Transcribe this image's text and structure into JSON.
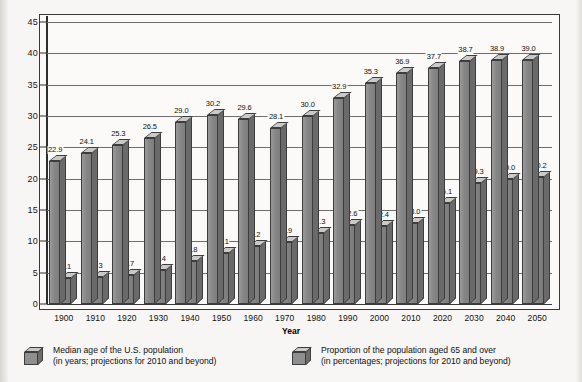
{
  "chart_data": {
    "type": "bar",
    "title": "",
    "xlabel": "Year",
    "ylabel": "",
    "ylim": [
      0,
      45
    ],
    "yticks": [
      "0",
      "5",
      "10",
      "15",
      "20",
      "25",
      "30",
      "35",
      "40",
      "45"
    ],
    "grid": true,
    "legend_position": "bottom",
    "categories": [
      "1900",
      "1910",
      "1920",
      "1930",
      "1940",
      "1950",
      "1960",
      "1970",
      "1980",
      "1990",
      "2000",
      "2010",
      "2020",
      "2030",
      "2040",
      "2050"
    ],
    "series": [
      {
        "name": "Median age of the U.S. population",
        "unit": "years",
        "values": [
          22.9,
          24.1,
          25.3,
          26.5,
          29.0,
          30.2,
          29.6,
          28.1,
          30.0,
          32.9,
          35.3,
          36.9,
          37.7,
          38.7,
          38.9,
          39.0
        ],
        "labels": [
          "22.9",
          "24.1",
          "25.3",
          "26.5",
          "29.0",
          "30.2",
          "29.6",
          "28.1",
          "30.0",
          "32.9",
          "35.3",
          "36.9",
          "37.7",
          "38.7",
          "38.9",
          "39.0"
        ]
      },
      {
        "name": "Proportion of the population aged 65 and over",
        "unit": "percent",
        "values": [
          4.1,
          4.3,
          4.7,
          5.4,
          6.8,
          8.1,
          9.2,
          9.9,
          11.3,
          12.6,
          12.4,
          13.0,
          16.1,
          19.3,
          20.0,
          20.2
        ],
        "labels": [
          "4.1",
          "4.3",
          "4.7",
          "5.4",
          "6.8",
          "8.1",
          "9.2",
          "9.9",
          "11.3",
          "12.6",
          "12.4",
          "13.0",
          "16.1",
          "19.3",
          "20.0",
          "20.2"
        ]
      }
    ]
  },
  "axis": {
    "x_title": "Year"
  },
  "legend": {
    "items": [
      {
        "line1": "Median age of the U.S. population",
        "line2": "(in years; projections for 2010 and beyond)"
      },
      {
        "line1": "Proportion of the population aged 65 and over",
        "line2": "(in percentages; projections for 2010 and beyond)"
      }
    ]
  },
  "colors": {
    "bar_face": "#8c8c8c",
    "bar_top": "#c9c9c9",
    "bar_side": "#6a6a6a",
    "outline": "#3d3d3d",
    "grid": "#6e6e6e",
    "paper": "#f7f6f4"
  }
}
